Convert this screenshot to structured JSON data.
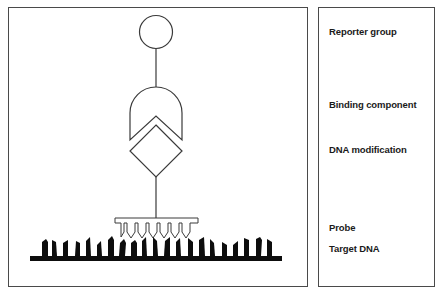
{
  "diagram": {
    "components": [
      {
        "id": "reporter",
        "shape": "circle"
      },
      {
        "id": "binding",
        "shape": "shield-with-chevron-notch"
      },
      {
        "id": "modification",
        "shape": "diamond"
      },
      {
        "id": "probe",
        "shape": "comb-outline"
      },
      {
        "id": "target",
        "shape": "solid-comb"
      }
    ]
  },
  "legend": {
    "labels": [
      {
        "text": "Reporter group",
        "top": 26
      },
      {
        "text": "Binding component",
        "top": 99
      },
      {
        "text": "DNA modification",
        "top": 144
      },
      {
        "text": "Probe",
        "top": 222
      },
      {
        "text": "Target DNA",
        "top": 243
      }
    ]
  },
  "colors": {
    "line": "#3a3a3a",
    "fill_dark": "#0d0d0d",
    "background": "#ffffff"
  }
}
